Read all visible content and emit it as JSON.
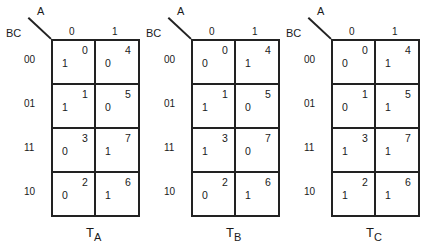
{
  "axes": {
    "row_variable": "BC",
    "column_variable": "A",
    "column_labels": [
      "0",
      "1"
    ],
    "row_labels": [
      "00",
      "01",
      "11",
      "10"
    ]
  },
  "maps": [
    {
      "title_base": "T",
      "title_sub": "A",
      "cells": [
        [
          {
            "value": "1",
            "minterm": "0"
          },
          {
            "value": "0",
            "minterm": "4"
          }
        ],
        [
          {
            "value": "1",
            "minterm": "1"
          },
          {
            "value": "0",
            "minterm": "5"
          }
        ],
        [
          {
            "value": "0",
            "minterm": "3"
          },
          {
            "value": "1",
            "minterm": "7"
          }
        ],
        [
          {
            "value": "0",
            "minterm": "2"
          },
          {
            "value": "1",
            "minterm": "6"
          }
        ]
      ]
    },
    {
      "title_base": "T",
      "title_sub": "B",
      "cells": [
        [
          {
            "value": "0",
            "minterm": "0"
          },
          {
            "value": "1",
            "minterm": "4"
          }
        ],
        [
          {
            "value": "1",
            "minterm": "1"
          },
          {
            "value": "0",
            "minterm": "5"
          }
        ],
        [
          {
            "value": "1",
            "minterm": "3"
          },
          {
            "value": "0",
            "minterm": "7"
          }
        ],
        [
          {
            "value": "0",
            "minterm": "2"
          },
          {
            "value": "1",
            "minterm": "6"
          }
        ]
      ]
    },
    {
      "title_base": "T",
      "title_sub": "C",
      "cells": [
        [
          {
            "value": "0",
            "minterm": "0"
          },
          {
            "value": "1",
            "minterm": "4"
          }
        ],
        [
          {
            "value": "0",
            "minterm": "1"
          },
          {
            "value": "1",
            "minterm": "5"
          }
        ],
        [
          {
            "value": "1",
            "minterm": "3"
          },
          {
            "value": "1",
            "minterm": "7"
          }
        ],
        [
          {
            "value": "1",
            "minterm": "2"
          },
          {
            "value": "1",
            "minterm": "6"
          }
        ]
      ]
    }
  ]
}
